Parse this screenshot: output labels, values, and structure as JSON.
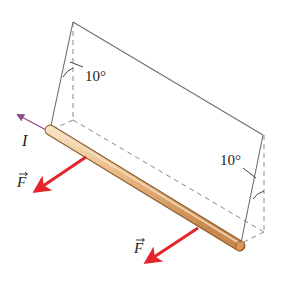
{
  "diagram": {
    "labels": {
      "current": "I",
      "force_left": "F",
      "force_right": "F",
      "angle_left": "10°",
      "angle_right": "10°"
    },
    "colors": {
      "frame_line": "#6e6e6e",
      "dashed_line": "#8a8a8a",
      "rod_fill": "#e8b884",
      "rod_highlight": "#f6dcbc",
      "rod_edge": "#8a5a2a",
      "force_arrow": "#e2262b",
      "current_arrow": "#8a4a8a",
      "text": "#222222"
    }
  }
}
